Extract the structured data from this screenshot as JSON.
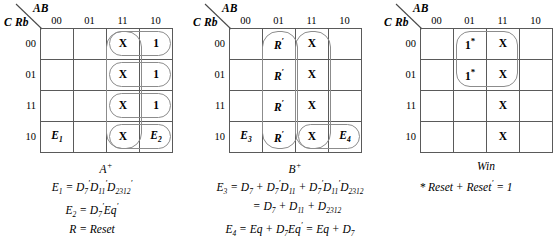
{
  "maps": [
    {
      "id": "a-plus",
      "col_var": "AB",
      "row_var": "C Rb",
      "col_headers": [
        "00",
        "01",
        "11",
        "10"
      ],
      "row_headers": [
        "00",
        "01",
        "11",
        "10"
      ],
      "caption": "A",
      "caption_sup": "+",
      "cells": [
        [
          "",
          "",
          "X",
          "1"
        ],
        [
          "",
          "",
          "X",
          "1"
        ],
        [
          "",
          "",
          "X",
          "1"
        ],
        [
          "E1",
          "",
          "X",
          "E2"
        ]
      ],
      "equations": [
        "E₁ = D₇′D₁₁′D₂₃₁₂′",
        "E₂ = D₇′Eq′",
        "R = Reset"
      ]
    },
    {
      "id": "b-plus",
      "col_var": "AB",
      "row_var": "C Rb",
      "col_headers": [
        "00",
        "01",
        "11",
        "10"
      ],
      "row_headers": [
        "00",
        "01",
        "11",
        "10"
      ],
      "caption": "B",
      "caption_sup": "+",
      "cells": [
        [
          "",
          "R'",
          "X",
          ""
        ],
        [
          "",
          "R'",
          "X",
          ""
        ],
        [
          "",
          "R'",
          "X",
          ""
        ],
        [
          "E3",
          "R'",
          "X",
          "E4"
        ]
      ],
      "equations": [
        "E₃ = D₇ + D₇′D₁₁ + D₇′D₁₁′D₂₃₁₂",
        "= D₇ + D₁₁ + D₂₃₁₂",
        "E₄ = Eq + D₇Eq′ = Eq + D₇"
      ]
    },
    {
      "id": "win",
      "col_var": "AB",
      "row_var": "C Rb",
      "col_headers": [
        "00",
        "01",
        "11",
        "10"
      ],
      "row_headers": [
        "00",
        "01",
        "11",
        "10"
      ],
      "caption": "Win",
      "caption_sup": "",
      "cells": [
        [
          "",
          "1*",
          "X",
          ""
        ],
        [
          "",
          "1*",
          "X",
          ""
        ],
        [
          "",
          "",
          "X",
          ""
        ],
        [
          "",
          "",
          "X",
          ""
        ]
      ],
      "equations": [
        "* Reset + Reset′ = 1"
      ]
    }
  ],
  "cell_text": {
    "x": "X",
    "one": "1",
    "one_star": "1",
    "star": "*",
    "r_prime": "R",
    "prime": "′",
    "E1": "E",
    "E2": "E",
    "E3": "E",
    "E4": "E",
    "sub1": "1",
    "sub2": "2",
    "sub3": "3",
    "sub4": "4"
  },
  "captions": {
    "map1": "A",
    "map1_sup": "+",
    "map2": "B",
    "map2_sup": "+",
    "map3": "Win"
  },
  "equations": {
    "map1": {
      "l1_lhs": "E",
      "l1_lhs_sub": "1",
      "l1_eq": " = ",
      "l1_d7": "D",
      "l1_d7_sub": "7",
      "l1_d7_sup": "′",
      "l1_d11": "D",
      "l1_d11_sub": "11",
      "l1_d11_sup": "′",
      "l1_d2312": "D",
      "l1_d2312_sub": "2312",
      "l1_d2312_sup": "′",
      "l2_lhs": "E",
      "l2_lhs_sub": "2",
      "l2_eq": " = ",
      "l2_d7": "D",
      "l2_d7_sub": "7",
      "l2_d7_sup": "′",
      "l2_eq_term": "Eq",
      "l2_eq_sup": "′",
      "l3": "R = Reset"
    },
    "map2": {
      "l1_lhs": "E",
      "l1_lhs_sub": "3",
      "l1_text": " = D",
      "l1_s1": "7",
      "l1_plus1": " + D",
      "l1_s2": "7",
      "l1_p1": "′",
      "l1_d2": "D",
      "l1_s3": "11",
      "l1_plus2": " + D",
      "l1_s4": "7",
      "l1_p2": "′",
      "l1_d3": "D",
      "l1_s5": "11",
      "l1_p3": "′",
      "l1_d4": "D",
      "l1_s6": "2312",
      "l2_text": "= D",
      "l2_s1": "7",
      "l2_plus1": " + D",
      "l2_s2": "11",
      "l2_plus2": " + D",
      "l2_s3": "2312",
      "l3_lhs": "E",
      "l3_lhs_sub": "4",
      "l3_text": " = Eq + D",
      "l3_s1": "7",
      "l3_eq2": "Eq",
      "l3_p1": "′",
      "l3_tail": " = Eq + D",
      "l3_s2": "7"
    },
    "map3": {
      "l1_star": "*",
      "l1_text": " Reset + Reset",
      "l1_prime": "′",
      "l1_tail": " = 1"
    }
  },
  "colors": {
    "grid_line": "#5a5a5a",
    "oval": "#8c8c8c",
    "text": "#000000",
    "background": "#ffffff"
  }
}
